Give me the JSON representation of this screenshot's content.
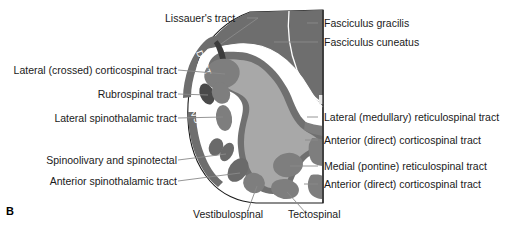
{
  "figure": {
    "panel_letter": "B",
    "colors": {
      "background": "#ffffff",
      "outline": "#1a1a1a",
      "dorsal_columns": "#6e6e6e",
      "central_gray": "#a8a8a8",
      "gray_matter_border": "#707070",
      "tract_blob": "#7e7e7e",
      "tract_blob_dark": "#4a4a4a",
      "white_matter": "#ffffff",
      "leader_line": "#8a8a8a",
      "divider_line": "#ffffff",
      "text": "#1a1a1a"
    }
  },
  "intra_labels": [
    {
      "text": "DSCT",
      "name": "dorsal-spinocerebellar-tract-label"
    },
    {
      "text": "VSCT",
      "name": "ventral-spinocerebellar-tract-label"
    }
  ],
  "labels_top": [
    {
      "text": "Lissauer's tract",
      "name": "label-lissauers-tract"
    }
  ],
  "labels_left": [
    {
      "text": "Lateral (crossed) corticospinal tract",
      "name": "label-lateral-crossed-corticospinal-tract"
    },
    {
      "text": "Rubrospinal tract",
      "name": "label-rubrospinal-tract"
    },
    {
      "text": "Lateral spinothalamic tract",
      "name": "label-lateral-spinothalamic-tract"
    },
    {
      "text": "Spinoolivary and spinotectal",
      "name": "label-spinoolivary-and-spinotectal"
    },
    {
      "text": "Anterior spinothalamic tract",
      "name": "label-anterior-spinothalamic-tract"
    }
  ],
  "labels_right": [
    {
      "text": "Fasciculus gracilis",
      "name": "label-fasciculus-gracilis"
    },
    {
      "text": "Fasciculus cuneatus",
      "name": "label-fasciculus-cuneatus"
    },
    {
      "text": "Lateral (medullary) reticulospinal tract",
      "name": "label-lateral-medullary-reticulospinal-tract"
    },
    {
      "text": "Anterior (direct) corticospinal tract",
      "name": "label-anterior-direct-corticospinal-tract-upper"
    },
    {
      "text": "Medial (pontine) reticulospinal tract",
      "name": "label-medial-pontine-reticulospinal-tract"
    },
    {
      "text": "Anterior (direct) corticospinal tract",
      "name": "label-anterior-direct-corticospinal-tract-lower"
    }
  ],
  "labels_bottom": [
    {
      "text": "Vestibulospinal",
      "name": "label-vestibulospinal"
    },
    {
      "text": "Tectospinal",
      "name": "label-tectospinal"
    }
  ]
}
